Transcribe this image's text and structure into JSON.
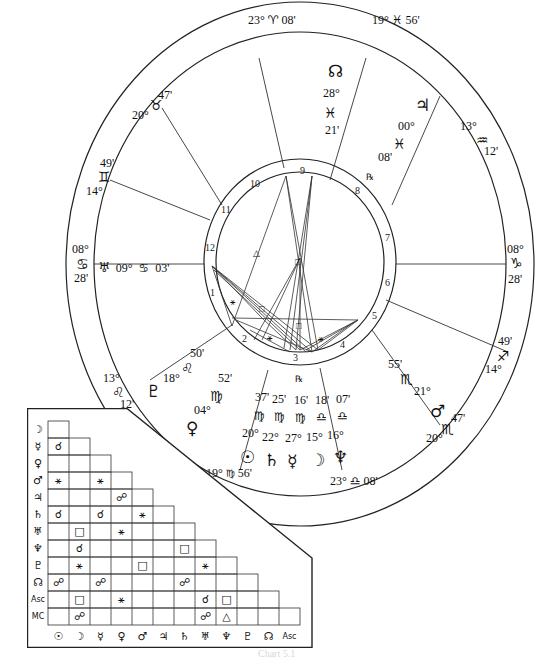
{
  "chart": {
    "type": "natal-wheel",
    "cusps": [
      {
        "id": "asc",
        "deg": "08°",
        "sign": "♋",
        "min": "28'"
      },
      {
        "id": "c2",
        "deg": "13°",
        "sign": "♌",
        "min": "12'"
      },
      {
        "id": "c3",
        "deg": "19°",
        "sign": "♍",
        "min": "56'"
      },
      {
        "id": "c4",
        "deg": "23°",
        "sign": "♎",
        "min": "08'"
      },
      {
        "id": "c5",
        "deg": "20°",
        "sign": "♏",
        "min": "47'"
      },
      {
        "id": "c6",
        "deg": "14°",
        "sign": "♐",
        "min": "49'"
      },
      {
        "id": "dsc",
        "deg": "08°",
        "sign": "♑",
        "min": "28'"
      },
      {
        "id": "c8",
        "deg": "13°",
        "sign": "♒",
        "min": "12'"
      },
      {
        "id": "c9",
        "deg": "19°",
        "sign": "♓",
        "min": "56'"
      },
      {
        "id": "mc",
        "deg": "23°",
        "sign": "♈",
        "min": "08'"
      },
      {
        "id": "c11",
        "deg": "20°",
        "sign": "♉",
        "min": "47'"
      },
      {
        "id": "c12",
        "deg": "14°",
        "sign": "♊",
        "min": "49'"
      }
    ],
    "house_numbers": [
      "1",
      "2",
      "3",
      "4",
      "5",
      "6",
      "7",
      "8",
      "9",
      "10",
      "11",
      "12"
    ],
    "planets": {
      "node": {
        "glyph": "☊",
        "deg": "28°",
        "sign": "♓",
        "min": "21'"
      },
      "jupiter": {
        "glyph": "♃",
        "deg": "00°",
        "sign": "♓",
        "min": "08'",
        "retro": "℞"
      },
      "uranus": {
        "glyph": "♅",
        "deg": "09°",
        "sign": "♋",
        "min": "03'"
      },
      "pluto": {
        "glyph": "♇",
        "deg": "18°",
        "sign": "♌",
        "min": "50'"
      },
      "venus": {
        "glyph": "♀",
        "deg": "04°",
        "sign": "♍",
        "min": "52'"
      },
      "sun": {
        "glyph": "☉",
        "deg": "20°",
        "sign": "♍",
        "min": "37'"
      },
      "saturn": {
        "glyph": "♄",
        "deg": "22°",
        "sign": "♍",
        "min": "25'"
      },
      "mercury": {
        "glyph": "☿",
        "deg": "27°",
        "sign": "♍",
        "min": "16'",
        "retro": "℞"
      },
      "moon": {
        "glyph": "☽",
        "deg": "15°",
        "sign": "♎",
        "min": "18'"
      },
      "neptune": {
        "glyph": "♆",
        "deg": "16°",
        "sign": "♎",
        "min": "07'"
      },
      "mars": {
        "glyph": "♂",
        "deg": "21°",
        "sign": "♏",
        "min": "55'"
      }
    },
    "center_aspect_glyphs": {
      "trine": "△",
      "square": "□",
      "sextile": "⚹",
      "opposition": "☍",
      "conjunction": "☌"
    }
  },
  "aspect_grid": {
    "row_labels": [
      "☽",
      "☿",
      "♀",
      "♂",
      "♃",
      "♄",
      "♅",
      "♆",
      "♇",
      "☊",
      "Asc",
      "MC"
    ],
    "col_labels": [
      "☉",
      "☽",
      "☿",
      "♀",
      "♂",
      "♃",
      "♄",
      "♅",
      "♆",
      "♇",
      "☊",
      "Asc"
    ],
    "rows": [
      [
        ""
      ],
      [
        "☌",
        ""
      ],
      [
        "",
        "",
        ""
      ],
      [
        "⚹",
        "",
        "⚹",
        ""
      ],
      [
        "",
        "",
        "",
        "☍",
        ""
      ],
      [
        "☌",
        "",
        "☌",
        "",
        "⚹",
        ""
      ],
      [
        "",
        "□",
        "",
        "⚹",
        "",
        "",
        ""
      ],
      [
        "",
        "☌",
        "",
        "",
        "",
        "",
        "□",
        ""
      ],
      [
        "",
        "⚹",
        "",
        "",
        "□",
        "",
        "",
        "⚹",
        ""
      ],
      [
        "☍",
        "",
        "☍",
        "",
        "",
        "",
        "☍",
        "",
        "",
        ""
      ],
      [
        "",
        "□",
        "",
        "⚹",
        "",
        "",
        "",
        "☌",
        "□",
        "",
        ""
      ],
      [
        "",
        "☍",
        "",
        "",
        "",
        "",
        "",
        "☍",
        "△",
        "",
        "",
        ""
      ]
    ]
  },
  "caption": "Chart 5.1"
}
